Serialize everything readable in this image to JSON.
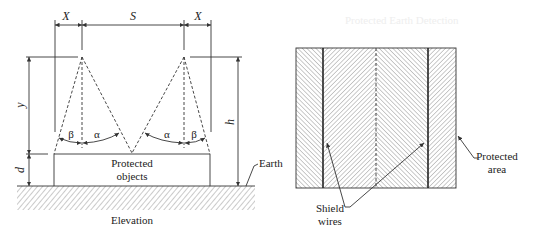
{
  "figure": {
    "elevation": {
      "caption": "Elevation",
      "dimensions": {
        "x_left": "X",
        "s": "S",
        "x_right": "X",
        "y": "y",
        "d": "d",
        "h": "h"
      },
      "angles": {
        "beta_left": "β",
        "alpha_left": "α",
        "alpha_right": "α",
        "beta_right": "β"
      },
      "protected_objects_line1": "Protected",
      "protected_objects_line2": "objects",
      "earth_label": "Earth"
    },
    "plan": {
      "shield_wires_line1": "Shield",
      "shield_wires_line2": "wires",
      "protected_area_line1": "Protected",
      "protected_area_line2": "area"
    },
    "background_bleed": {
      "heading": "Protected Earth Detection"
    }
  },
  "colors": {
    "line": "#333333",
    "hatch": "#8a8a8a",
    "background": "#ffffff"
  }
}
